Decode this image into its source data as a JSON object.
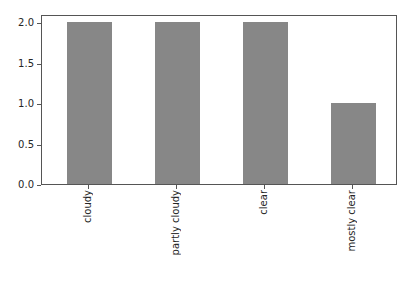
{
  "chart_data": {
    "type": "bar",
    "title": "",
    "xlabel": "",
    "ylabel": "",
    "categories": [
      "cloudy",
      "partly cloudy",
      "clear",
      "mostly clear"
    ],
    "values": [
      2,
      2,
      2,
      1
    ],
    "yticks": [
      "0.0",
      "0.5",
      "1.0",
      "1.5",
      "2.0"
    ],
    "ylim": [
      0,
      2.1
    ],
    "xtick_label_rotation_deg": 90,
    "grid": false,
    "legend": false,
    "bar_color": "#878787",
    "spine_color": "#555555",
    "text_color": "#262626",
    "background_color": "#ffffff"
  }
}
